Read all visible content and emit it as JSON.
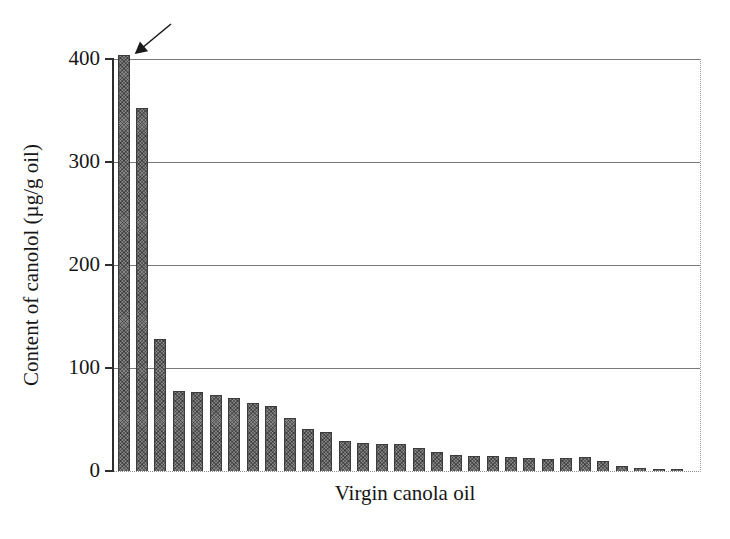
{
  "chart_data": {
    "type": "bar",
    "title": "",
    "xlabel": "Virgin canola oil",
    "ylabel": "Content of canolol (µg/g oil)",
    "ylim": [
      0,
      400
    ],
    "yticks": [
      0,
      100,
      200,
      300,
      400
    ],
    "ytick_labels": [
      "0",
      "100",
      "200",
      "300",
      "400"
    ],
    "grid": "horizontal solid lines at every 100 units; dotted right and bottom plot borders",
    "legend": "none",
    "n_bars": 31,
    "categories": "31 unlabeled virgin canola oil samples, sorted descending",
    "values": [
      400,
      352,
      128,
      78,
      77,
      74,
      71,
      66,
      63,
      51,
      41,
      38,
      29,
      27,
      26,
      26,
      22,
      18,
      16,
      15,
      15,
      14,
      13,
      12,
      13,
      14,
      10,
      5,
      3,
      2,
      2
    ],
    "first_bar_offscale": true,
    "annotation": "diagonal arrow from upper right pointing to the top of the first bar, which is clipped at the 400 axis maximum",
    "bar_color": "#858585",
    "bar_border_color": "#3c3c3c",
    "gridline_color": "#787878",
    "text_color": "#161616"
  }
}
